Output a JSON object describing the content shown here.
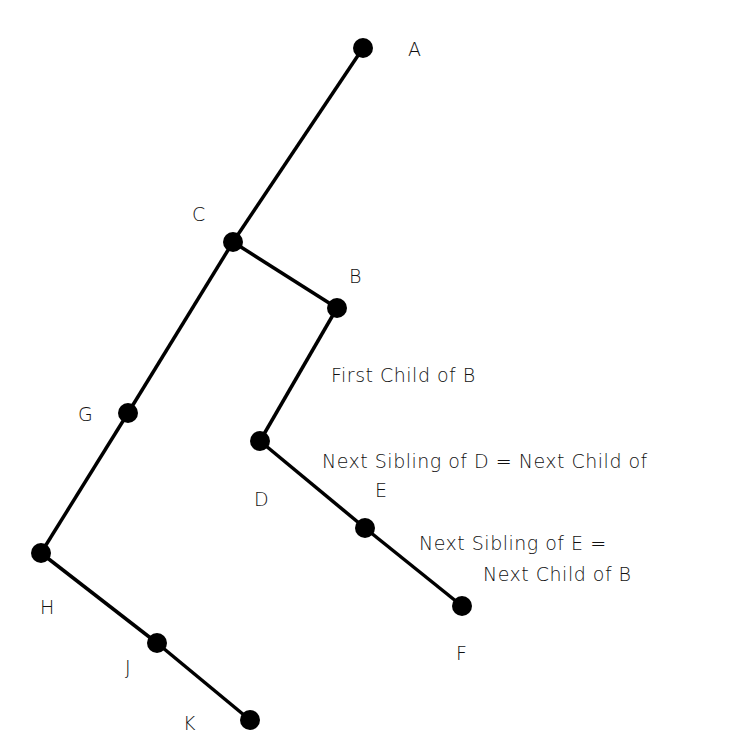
{
  "nodes": {
    "A": {
      "label": "A"
    },
    "B": {
      "label": "B"
    },
    "C": {
      "label": "C"
    },
    "D": {
      "label": "D"
    },
    "E": {
      "label": "E"
    },
    "F": {
      "label": "F"
    },
    "G": {
      "label": "G"
    },
    "H": {
      "label": "H"
    },
    "J": {
      "label": "J"
    },
    "K": {
      "label": "K"
    }
  },
  "annotations": {
    "first_child": "First Child of B",
    "next_sibling_d": "Next Sibling of D = Next Child of",
    "next_sibling_e_1": "Next Sibling of E =",
    "next_sibling_e_2": "Next Child of B"
  }
}
